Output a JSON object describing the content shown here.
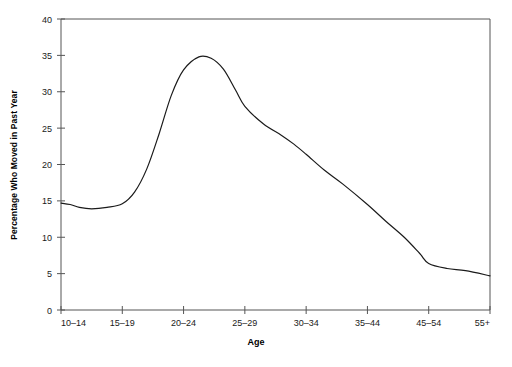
{
  "chart_data": {
    "type": "line",
    "title": "",
    "xlabel": "Age",
    "ylabel": "Percentage Who Moved in Past Year",
    "categories": [
      "10–14",
      "15–19",
      "20–24",
      "25–29",
      "30–34",
      "35–44",
      "45–54",
      "55+"
    ],
    "values": [
      14.7,
      14.6,
      33.0,
      28.0,
      21.4,
      14.5,
      6.4,
      4.7
    ],
    "series": [
      {
        "name": "Percentage Who Moved in Past Year",
        "values": [
          14.7,
          14.6,
          33.0,
          28.0,
          21.4,
          14.5,
          6.4,
          4.7
        ]
      }
    ],
    "curve_points": [
      {
        "x": 0.0,
        "y": 14.7
      },
      {
        "x": 0.15,
        "y": 14.5
      },
      {
        "x": 0.3,
        "y": 14.1
      },
      {
        "x": 0.5,
        "y": 13.9
      },
      {
        "x": 0.75,
        "y": 14.1
      },
      {
        "x": 1.0,
        "y": 14.6
      },
      {
        "x": 1.2,
        "y": 16.2
      },
      {
        "x": 1.4,
        "y": 19.4
      },
      {
        "x": 1.6,
        "y": 24.2
      },
      {
        "x": 1.8,
        "y": 29.5
      },
      {
        "x": 2.0,
        "y": 33.0
      },
      {
        "x": 2.25,
        "y": 34.8
      },
      {
        "x": 2.45,
        "y": 34.6
      },
      {
        "x": 2.65,
        "y": 33.1
      },
      {
        "x": 2.85,
        "y": 30.2
      },
      {
        "x": 3.0,
        "y": 28.0
      },
      {
        "x": 3.3,
        "y": 25.6
      },
      {
        "x": 3.6,
        "y": 24.0
      },
      {
        "x": 3.8,
        "y": 22.8
      },
      {
        "x": 4.0,
        "y": 21.4
      },
      {
        "x": 4.3,
        "y": 19.2
      },
      {
        "x": 4.6,
        "y": 17.3
      },
      {
        "x": 5.0,
        "y": 14.5
      },
      {
        "x": 5.3,
        "y": 12.2
      },
      {
        "x": 5.6,
        "y": 10.0
      },
      {
        "x": 5.85,
        "y": 7.8
      },
      {
        "x": 6.0,
        "y": 6.4
      },
      {
        "x": 6.3,
        "y": 5.7
      },
      {
        "x": 6.6,
        "y": 5.4
      },
      {
        "x": 7.0,
        "y": 4.7
      }
    ],
    "ylim": [
      0,
      40
    ],
    "yticks": [
      "0",
      "5",
      "10",
      "15",
      "20",
      "25",
      "30",
      "35",
      "40"
    ],
    "ytick_values": [
      0,
      5,
      10,
      15,
      20,
      25,
      30,
      35,
      40
    ],
    "grid": false,
    "legend": "none",
    "line_color": "#1a1a1a",
    "axis_color": "#555555",
    "background": "#ffffff"
  }
}
